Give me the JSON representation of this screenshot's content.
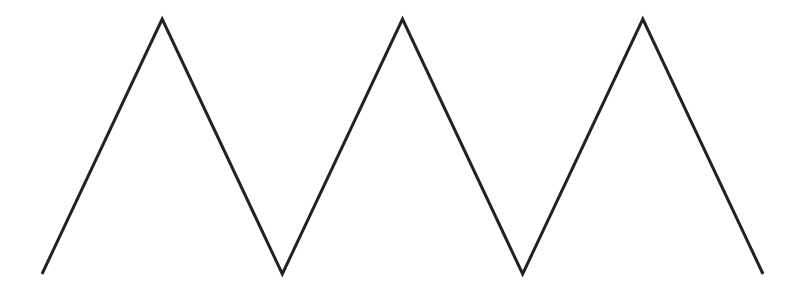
{
  "diagram": {
    "type": "zigzag-line",
    "stroke_color": "#222222",
    "background_color": "#ffffff",
    "peaks": 3,
    "troughs": 2,
    "vertex_sequence": [
      "low",
      "high",
      "low",
      "high",
      "low",
      "high",
      "low"
    ]
  }
}
